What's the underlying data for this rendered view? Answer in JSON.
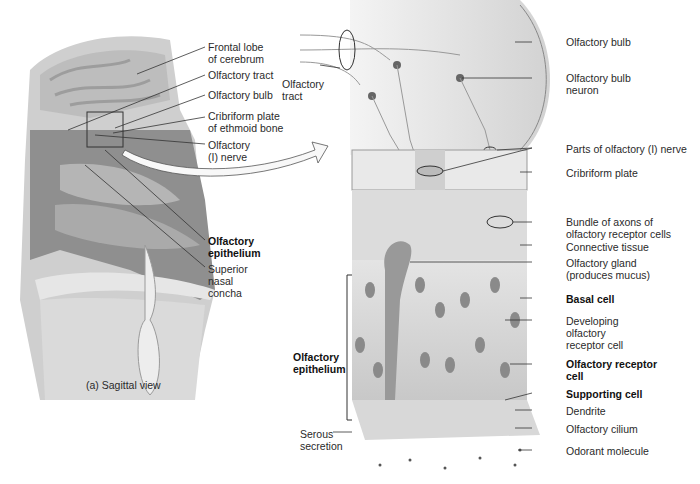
{
  "figure": {
    "panel_a": {
      "caption": "(a) Sagittal view",
      "labels": [
        {
          "id": "frontal-lobe",
          "lines": [
            "Frontal lobe",
            "of cerebrum"
          ],
          "bold": false
        },
        {
          "id": "olfactory-tract",
          "lines": [
            "Olfactory tract"
          ],
          "bold": false
        },
        {
          "id": "olfactory-bulb",
          "lines": [
            "Olfactory bulb"
          ],
          "bold": false
        },
        {
          "id": "cribriform-plate",
          "lines": [
            "Cribriform plate",
            "of ethmoid bone"
          ],
          "bold": false
        },
        {
          "id": "olfactory-nerve",
          "lines": [
            "Olfactory",
            "(I) nerve"
          ],
          "bold": false
        },
        {
          "id": "olfactory-epithelium",
          "lines": [
            "Olfactory",
            "epithelium"
          ],
          "bold": true
        },
        {
          "id": "superior-nasal-concha",
          "lines": [
            "Superior",
            "nasal",
            "concha"
          ],
          "bold": false
        }
      ]
    },
    "panel_b": {
      "left_labels": [
        {
          "id": "olfactory-tract-b",
          "lines": [
            "Olfactory",
            "tract"
          ],
          "bold": false
        },
        {
          "id": "olfactory-epithelium-b",
          "lines": [
            "Olfactory",
            "epithelium"
          ],
          "bold": true
        },
        {
          "id": "serous-secretion",
          "lines": [
            "Serous",
            "secretion"
          ],
          "bold": false
        }
      ],
      "right_labels": [
        {
          "id": "olfactory-bulb-b",
          "lines": [
            "Olfactory bulb"
          ],
          "bold": false
        },
        {
          "id": "olfactory-bulb-neuron",
          "lines": [
            "Olfactory bulb",
            "neuron"
          ],
          "bold": false
        },
        {
          "id": "parts-of-nerve",
          "lines": [
            "Parts of olfactory (I) nerve"
          ],
          "bold": false
        },
        {
          "id": "cribriform-plate-b",
          "lines": [
            "Cribriform plate"
          ],
          "bold": false
        },
        {
          "id": "bundle-axons",
          "lines": [
            "Bundle of axons of",
            "olfactory receptor cells"
          ],
          "bold": false
        },
        {
          "id": "connective-tissue",
          "lines": [
            "Connective tissue"
          ],
          "bold": false
        },
        {
          "id": "olfactory-gland",
          "lines": [
            "Olfactory gland",
            "(produces mucus)"
          ],
          "bold": false
        },
        {
          "id": "basal-cell",
          "lines": [
            "Basal cell"
          ],
          "bold": true
        },
        {
          "id": "developing-receptor",
          "lines": [
            "Developing",
            "olfactory",
            "receptor cell"
          ],
          "bold": false
        },
        {
          "id": "olfactory-receptor-cell",
          "lines": [
            "Olfactory receptor",
            "cell"
          ],
          "bold": true
        },
        {
          "id": "supporting-cell",
          "lines": [
            "Supporting cell"
          ],
          "bold": true
        },
        {
          "id": "dendrite",
          "lines": [
            "Dendrite"
          ],
          "bold": false
        },
        {
          "id": "olfactory-cilium",
          "lines": [
            "Olfactory cilium"
          ],
          "bold": false
        },
        {
          "id": "odorant-molecule",
          "lines": [
            "Odorant molecule"
          ],
          "bold": false
        }
      ]
    }
  }
}
